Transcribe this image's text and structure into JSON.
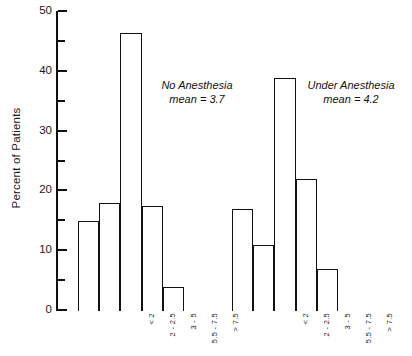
{
  "chart_data": {
    "type": "bar",
    "title": "",
    "xlabel": "",
    "ylabel": "Percent of Patients",
    "ylim": [
      0,
      50
    ],
    "yticks": [
      0,
      10,
      20,
      30,
      40,
      50
    ],
    "yticks_minor": [
      5,
      15,
      25,
      35,
      45
    ],
    "ytick_labels": [
      "0",
      "10",
      "20",
      "30",
      "40",
      "50"
    ],
    "grid": false,
    "legend_position": "none",
    "categories": [
      "< 2",
      "2 - 2.5",
      "3 - 5",
      "5.5 - 7.5",
      "> 7.5"
    ],
    "series": [
      {
        "name": "No Anesthesia",
        "mean": 3.7,
        "annotation_line1": "No Anesthesia",
        "annotation_line2": "mean = 3.7",
        "values": [
          15,
          18,
          46.5,
          17.5,
          4
        ]
      },
      {
        "name": "Under Anesthesia",
        "mean": 4.2,
        "annotation_line1": "Under Anesthesia",
        "annotation_line2": "mean = 4.2",
        "values": [
          17,
          11,
          39,
          22,
          7
        ]
      }
    ]
  }
}
